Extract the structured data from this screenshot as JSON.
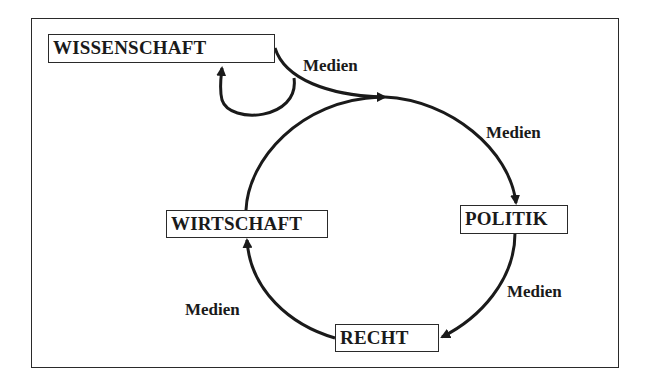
{
  "diagram": {
    "nodes": {
      "wissenschaft": "WISSENSCHAFT",
      "politik": "POLITIK",
      "recht": "RECHT",
      "wirtschaft": "WIRTSCHAFT"
    },
    "edge_labels": {
      "top_left": "Medien",
      "top_right": "Medien",
      "bottom_right": "Medien",
      "bottom_left": "Medien"
    },
    "edges": [
      {
        "from": "WISSENSCHAFT",
        "to": "cycle",
        "label": "Medien"
      },
      {
        "from": "cycle",
        "to": "WISSENSCHAFT",
        "label": ""
      },
      {
        "from": "cycle",
        "to": "POLITIK",
        "label": "Medien"
      },
      {
        "from": "POLITIK",
        "to": "RECHT",
        "label": "Medien"
      },
      {
        "from": "RECHT",
        "to": "WIRTSCHAFT",
        "label": "Medien"
      },
      {
        "from": "WIRTSCHAFT",
        "to": "cycle",
        "label": ""
      }
    ],
    "colors": {
      "stroke": "#1a1a1a",
      "background": "#ffffff"
    }
  }
}
